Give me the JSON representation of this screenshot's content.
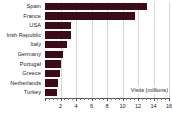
{
  "chart_data": {
    "type": "bar",
    "orientation": "horizontal",
    "title": "",
    "xlabel": "Visits (millions)",
    "ylabel": "",
    "xlim": [
      0,
      16
    ],
    "ylim": null,
    "grid": true,
    "legend": null,
    "bar_color": "#3d0a18",
    "gridline_color": "#d7d7d7",
    "axis_color": "#555555",
    "xticks": [
      0,
      2,
      4,
      6,
      8,
      10,
      12,
      14,
      16
    ],
    "xtick_labels": [
      "",
      "2",
      "4",
      "6",
      "8",
      "10",
      "12",
      "14",
      "16"
    ],
    "xtick_minor_step": 0.5,
    "categories": [
      "Spain",
      "France",
      "USA",
      "Irish Republic",
      "Italy",
      "Germany",
      "Portugal",
      "Greece",
      "Netherlands",
      "Turkey"
    ],
    "values": [
      13.2,
      11.6,
      3.3,
      3.3,
      2.8,
      2.3,
      2.1,
      1.9,
      1.7,
      1.5
    ]
  }
}
